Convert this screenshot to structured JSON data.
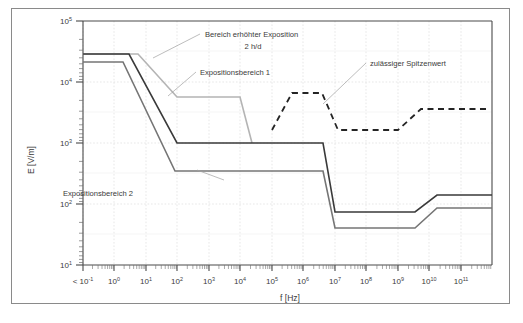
{
  "figure": {
    "background_color": "#ffffff",
    "frame_color": "#8a8a8a",
    "grid_color": "#d8d8d8",
    "axis_color": "#4a4a4a"
  },
  "chart_data": {
    "type": "line",
    "title": "",
    "xlabel": "f [Hz]",
    "ylabel": "E [V/m]",
    "xscale": "log",
    "yscale": "log",
    "xlim": [
      0.05,
      500000000000.0
    ],
    "ylim": [
      10,
      100000
    ],
    "grid": true,
    "legend_position": "inline-annotations",
    "x_tick_labels": [
      "< 10⁻¹",
      "10⁰",
      "10¹",
      "10²",
      "10³",
      "10⁴",
      "10⁵",
      "10⁶",
      "10⁷",
      "10⁸",
      "10⁹",
      "10¹⁰",
      "10¹¹"
    ],
    "x_tick_values": [
      0.1,
      1,
      10,
      100,
      1000,
      10000,
      100000,
      1000000,
      10000000,
      100000000,
      1000000000,
      10000000000,
      100000000000
    ],
    "y_tick_labels": [
      "10¹",
      "10²",
      "10³",
      "10⁴",
      "10⁵"
    ],
    "y_tick_values": [
      10,
      100,
      1000,
      10000,
      100000
    ],
    "series": [
      {
        "name": "Bereich erhöhter Exposition 2 h/d",
        "color": "#b4b4b4",
        "style": "solid",
        "width": 1.6,
        "points": [
          [
            0.05,
            30000
          ],
          [
            60,
            30000
          ],
          [
            1000,
            2000
          ],
          [
            50000,
            2000
          ],
          [
            120000,
            1000
          ]
        ]
      },
      {
        "name": "Expositionsbereich 1",
        "color": "#3a3a3a",
        "style": "solid",
        "width": 1.6,
        "points": [
          [
            0.05,
            30000
          ],
          [
            25,
            30000
          ],
          [
            1000,
            1000
          ],
          [
            2000000,
            1000
          ],
          [
            10000000,
            66
          ],
          [
            400000000,
            66
          ],
          [
            2000000000,
            145
          ],
          [
            500000000000,
            145
          ]
        ]
      },
      {
        "name": "Expositionsbereich 2",
        "color": "#757575",
        "style": "solid",
        "width": 1.6,
        "points": [
          [
            0.05,
            20000
          ],
          [
            15,
            20000
          ],
          [
            900,
            350
          ],
          [
            2000000,
            350
          ],
          [
            10000000,
            28
          ],
          [
            400000000,
            28
          ],
          [
            2000000000,
            68
          ],
          [
            500000000000,
            68
          ]
        ]
      },
      {
        "name": "zulässiger Spitzenwert",
        "color": "#242424",
        "style": "dashed",
        "width": 1.8,
        "points": [
          [
            100000,
            2000
          ],
          [
            400000,
            7000
          ],
          [
            2000000,
            7000
          ],
          [
            7000000,
            2000
          ],
          [
            400000000,
            2000
          ],
          [
            2000000000,
            4500
          ],
          [
            400000000000,
            4500
          ]
        ]
      }
    ],
    "annotations": [
      {
        "id": "bereich-erhoehter-exposition",
        "line1": "Bereich erhöhter Exposition",
        "line2": "2 h/d",
        "anchor": "leader-to-light-gray-curve"
      },
      {
        "id": "expositionsbereich-1",
        "line1": "Expositionsbereich 1",
        "line2": "",
        "anchor": "leader-to-dark-curve"
      },
      {
        "id": "expositionsbereich-2",
        "line1": "Expositionsbereich 2",
        "line2": "",
        "anchor": "leader-to-medium-gray-curve"
      },
      {
        "id": "zulaessiger-spitzenwert",
        "line1": "zulässiger Spitzenwert",
        "line2": "",
        "anchor": "leader-to-dashed-curve"
      }
    ]
  }
}
